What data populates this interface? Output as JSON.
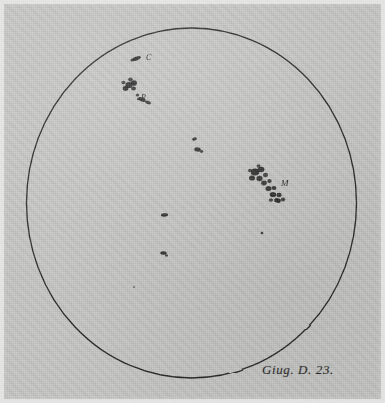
{
  "plate": {
    "title": "Solar disk with sunspots",
    "caption": "Giug. D. 23.",
    "background_color": "#c6c6c4",
    "ink_color": "#1c1c1c",
    "disk": {
      "center_x": 191.5,
      "center_y": 203,
      "radius_x": 165,
      "radius_y": 175,
      "stroke_width": 1.3
    }
  },
  "labels": {
    "c": "C",
    "r": "R",
    "m": "M"
  },
  "chart_data": {
    "type": "scatter",
    "annotations": [
      "C",
      "R",
      "M",
      "Giug. D. 23."
    ],
    "xlabel": "",
    "ylabel": "",
    "xlim": [
      26.5,
      356.5
    ],
    "ylim": [
      28,
      378
    ],
    "grid": false,
    "legend": null,
    "disk_outline": {
      "cx": 191.5,
      "cy": 203,
      "rx": 165,
      "ry": 175
    },
    "groups": [
      {
        "name": "C",
        "label": "C",
        "label_x": 146,
        "label_y": 54,
        "spots": [
          {
            "x": 136.5,
            "y": 58.5,
            "rx": 4.6,
            "ry": 1.9,
            "rot": -22,
            "opacity": 0.93
          },
          {
            "x": 132.5,
            "y": 60.0,
            "rx": 2.2,
            "ry": 1.5,
            "rot": -15,
            "opacity": 0.8
          }
        ]
      },
      {
        "name": "R",
        "label": "R",
        "label_x": 141,
        "label_y": 94,
        "spots": [
          {
            "x": 129.0,
            "y": 85.0,
            "rx": 3.6,
            "ry": 3.1,
            "rot": 0,
            "opacity": 0.95
          },
          {
            "x": 134.0,
            "y": 83.0,
            "rx": 3.0,
            "ry": 2.7,
            "rot": 0,
            "opacity": 0.95
          },
          {
            "x": 125.5,
            "y": 88.5,
            "rx": 2.8,
            "ry": 2.4,
            "rot": 0,
            "opacity": 0.92
          },
          {
            "x": 133.5,
            "y": 88.5,
            "rx": 2.4,
            "ry": 2.1,
            "rot": 0,
            "opacity": 0.9
          },
          {
            "x": 130.5,
            "y": 79.5,
            "rx": 2.3,
            "ry": 2.0,
            "rot": 0,
            "opacity": 0.85
          },
          {
            "x": 123.5,
            "y": 82.5,
            "rx": 2.0,
            "ry": 1.8,
            "rot": 0,
            "opacity": 0.8
          },
          {
            "x": 137.5,
            "y": 95.0,
            "rx": 1.7,
            "ry": 1.5,
            "rot": 0,
            "opacity": 0.82
          },
          {
            "x": 142.0,
            "y": 99.5,
            "rx": 3.9,
            "ry": 2.0,
            "rot": 24,
            "opacity": 0.94
          },
          {
            "x": 148.0,
            "y": 102.5,
            "rx": 3.0,
            "ry": 1.7,
            "rot": 18,
            "opacity": 0.9
          },
          {
            "x": 138.5,
            "y": 99.0,
            "rx": 1.6,
            "ry": 1.3,
            "rot": 0,
            "opacity": 0.75
          }
        ]
      },
      {
        "name": "center-pair",
        "label": "",
        "label_x": 0,
        "label_y": 0,
        "spots": [
          {
            "x": 194.5,
            "y": 139.0,
            "rx": 2.4,
            "ry": 1.6,
            "rot": -12,
            "opacity": 0.92
          },
          {
            "x": 197.5,
            "y": 149.5,
            "rx": 3.3,
            "ry": 2.1,
            "rot": 8,
            "opacity": 0.95
          },
          {
            "x": 201.5,
            "y": 151.5,
            "rx": 1.7,
            "ry": 1.4,
            "rot": 0,
            "opacity": 0.85
          }
        ]
      },
      {
        "name": "M",
        "label": "M",
        "label_x": 281,
        "label_y": 179,
        "spots": [
          {
            "x": 255.0,
            "y": 172.0,
            "rx": 4.2,
            "ry": 3.5,
            "rot": 0,
            "opacity": 0.95
          },
          {
            "x": 261.0,
            "y": 169.5,
            "rx": 3.4,
            "ry": 2.8,
            "rot": 0,
            "opacity": 0.93
          },
          {
            "x": 252.0,
            "y": 178.0,
            "rx": 3.0,
            "ry": 2.6,
            "rot": 0,
            "opacity": 0.9
          },
          {
            "x": 259.5,
            "y": 178.5,
            "rx": 3.1,
            "ry": 2.7,
            "rot": 0,
            "opacity": 0.92
          },
          {
            "x": 265.5,
            "y": 175.0,
            "rx": 2.5,
            "ry": 2.2,
            "rot": 0,
            "opacity": 0.86
          },
          {
            "x": 264.0,
            "y": 183.0,
            "rx": 2.8,
            "ry": 2.4,
            "rot": 0,
            "opacity": 0.9
          },
          {
            "x": 269.5,
            "y": 181.0,
            "rx": 2.2,
            "ry": 1.9,
            "rot": 0,
            "opacity": 0.84
          },
          {
            "x": 268.5,
            "y": 188.5,
            "rx": 3.0,
            "ry": 2.5,
            "rot": 0,
            "opacity": 0.92
          },
          {
            "x": 274.0,
            "y": 188.0,
            "rx": 2.4,
            "ry": 2.1,
            "rot": 0,
            "opacity": 0.88
          },
          {
            "x": 273.0,
            "y": 194.5,
            "rx": 3.2,
            "ry": 2.6,
            "rot": 0,
            "opacity": 0.93
          },
          {
            "x": 279.0,
            "y": 195.0,
            "rx": 2.6,
            "ry": 2.2,
            "rot": 0,
            "opacity": 0.9
          },
          {
            "x": 277.5,
            "y": 200.5,
            "rx": 3.4,
            "ry": 2.4,
            "rot": 12,
            "opacity": 0.94
          },
          {
            "x": 283.0,
            "y": 199.5,
            "rx": 2.2,
            "ry": 1.9,
            "rot": 0,
            "opacity": 0.86
          },
          {
            "x": 271.0,
            "y": 200.0,
            "rx": 2.2,
            "ry": 1.8,
            "rot": 0,
            "opacity": 0.8
          },
          {
            "x": 258.5,
            "y": 166.0,
            "rx": 2.0,
            "ry": 1.7,
            "rot": 0,
            "opacity": 0.8
          },
          {
            "x": 250.0,
            "y": 170.5,
            "rx": 2.0,
            "ry": 1.8,
            "rot": 0,
            "opacity": 0.82
          }
        ]
      },
      {
        "name": "lower-left-pair",
        "label": "",
        "label_x": 0,
        "label_y": 0,
        "spots": [
          {
            "x": 164.5,
            "y": 215.0,
            "rx": 3.6,
            "ry": 1.7,
            "rot": -4,
            "opacity": 0.95
          },
          {
            "x": 163.5,
            "y": 253.0,
            "rx": 3.3,
            "ry": 1.8,
            "rot": 5,
            "opacity": 0.93
          },
          {
            "x": 166.5,
            "y": 255.5,
            "rx": 1.5,
            "ry": 1.2,
            "rot": 0,
            "opacity": 0.8
          }
        ]
      },
      {
        "name": "minor-dots",
        "label": "",
        "label_x": 0,
        "label_y": 0,
        "spots": [
          {
            "x": 262.0,
            "y": 233.0,
            "rx": 1.3,
            "ry": 1.2,
            "rot": 0,
            "opacity": 0.85
          },
          {
            "x": 134.0,
            "y": 287.0,
            "rx": 1.1,
            "ry": 1.0,
            "rot": 0,
            "opacity": 0.45
          }
        ]
      }
    ]
  }
}
